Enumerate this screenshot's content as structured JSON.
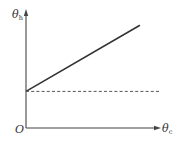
{
  "chart_data": {
    "type": "line",
    "title": "",
    "xlabel": "θc",
    "ylabel": "θh",
    "x_axis": {
      "symbol": "θ",
      "subscript": "c"
    },
    "y_axis": {
      "symbol": "θ",
      "subscript": "h"
    },
    "origin_label": "O",
    "xlim": [
      0,
      1
    ],
    "ylim": [
      0,
      1
    ],
    "grid": false,
    "ticks": "none",
    "series": [
      {
        "name": "solid-line",
        "style": "solid",
        "x": [
          0,
          0.85
        ],
        "y": [
          0.31,
          0.87
        ]
      },
      {
        "name": "dashed-line",
        "style": "dashed",
        "x": [
          0,
          1.0
        ],
        "y": [
          0.31,
          0.31
        ]
      }
    ]
  }
}
